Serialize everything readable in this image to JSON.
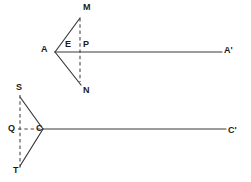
{
  "diagram": {
    "stroke_color": "#3a3a3a",
    "dash_color": "#4a4a4a",
    "background_color": "#ffffff",
    "figures": [
      {
        "name": "upper-figure",
        "vertex": "A",
        "ray_end": "A'",
        "arm_top_end": "M",
        "arm_bottom_end": "N",
        "interior_points": [
          "E",
          "P"
        ]
      },
      {
        "name": "lower-figure",
        "vertex": "C",
        "ray_end": "C'",
        "arm_top_end": "S",
        "arm_bottom_end": "T",
        "interior_points": [
          "Q"
        ]
      }
    ],
    "labels": [
      {
        "id": "label-M",
        "text": "M",
        "x": 83,
        "y": 3,
        "figure": "upper"
      },
      {
        "id": "label-A",
        "text": "A",
        "x": 41,
        "y": 45,
        "figure": "upper"
      },
      {
        "id": "label-E",
        "text": "E",
        "x": 65,
        "y": 40,
        "figure": "upper"
      },
      {
        "id": "label-P",
        "text": "P",
        "x": 83,
        "y": 40,
        "figure": "upper"
      },
      {
        "id": "label-Aprime",
        "text": "A'",
        "x": 224,
        "y": 46,
        "figure": "upper"
      },
      {
        "id": "label-N",
        "text": "N",
        "x": 83,
        "y": 86,
        "figure": "upper"
      },
      {
        "id": "label-S",
        "text": "S",
        "x": 16,
        "y": 83,
        "figure": "lower"
      },
      {
        "id": "label-Q",
        "text": "Q",
        "x": 8,
        "y": 124,
        "figure": "lower"
      },
      {
        "id": "label-C",
        "text": "C",
        "x": 36,
        "y": 124,
        "figure": "lower"
      },
      {
        "id": "label-Cprime",
        "text": "C'",
        "x": 228,
        "y": 126,
        "figure": "lower"
      },
      {
        "id": "label-T",
        "text": "T",
        "x": 13,
        "y": 166,
        "figure": "lower"
      }
    ],
    "segments": [
      {
        "id": "upper-arm-top",
        "x1": 55,
        "y1": 52,
        "x2": 80,
        "y2": 18,
        "style": "solid"
      },
      {
        "id": "upper-arm-bottom",
        "x1": 55,
        "y1": 52,
        "x2": 81,
        "y2": 85,
        "style": "solid"
      },
      {
        "id": "upper-ray",
        "x1": 55,
        "y1": 52,
        "x2": 222,
        "y2": 52,
        "style": "solid"
      },
      {
        "id": "upper-dashed-MN",
        "x1": 80,
        "y1": 18,
        "x2": 80,
        "y2": 82,
        "style": "dashed"
      },
      {
        "id": "lower-arm-top",
        "x1": 43,
        "y1": 129,
        "x2": 20,
        "y2": 97,
        "style": "solid"
      },
      {
        "id": "lower-arm-bottom",
        "x1": 43,
        "y1": 129,
        "x2": 20,
        "y2": 166,
        "style": "solid"
      },
      {
        "id": "lower-ray",
        "x1": 43,
        "y1": 129,
        "x2": 226,
        "y2": 129,
        "style": "solid"
      },
      {
        "id": "lower-dashed-ST",
        "x1": 20,
        "y1": 95,
        "x2": 20,
        "y2": 168,
        "style": "dashed"
      },
      {
        "id": "lower-dashed-QC",
        "x1": 18,
        "y1": 129,
        "x2": 42,
        "y2": 129,
        "style": "dashed"
      }
    ]
  }
}
